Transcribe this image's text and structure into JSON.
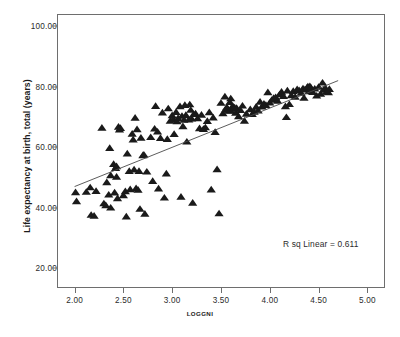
{
  "chart_data": {
    "type": "scatter",
    "title": "",
    "xlabel": "LOGGNI",
    "ylabel": "Life expectancy at birth, total (years)",
    "xlim": [
      1.82,
      5.18
    ],
    "ylim": [
      13.5,
      104.0
    ],
    "grid": false,
    "legend": null,
    "xticks": [
      "2.00",
      "2.50",
      "3.00",
      "3.50",
      "4.00",
      "4.50",
      "5.00"
    ],
    "xtick_values": [
      2.0,
      2.5,
      3.0,
      3.5,
      4.0,
      4.5,
      5.0
    ],
    "yticks": [
      "20.00",
      "40.00",
      "60.00",
      "80.00",
      "100.00"
    ],
    "ytick_values": [
      20,
      40,
      60,
      80,
      100
    ],
    "annotations": [
      {
        "text": "R sq Linear = 0.611",
        "x": 4.47,
        "y": 29.5
      }
    ],
    "fit_line": {
      "type": "linear",
      "r_squared": 0.611,
      "x": [
        2.0,
        4.7
      ],
      "y": [
        47.0,
        82.0
      ],
      "color": "#4a4a4a"
    },
    "marker": {
      "shape": "triangle-up",
      "color": "#1a1a1a",
      "size": 4.6
    },
    "points": [
      [
        2.01,
        45.0
      ],
      [
        2.02,
        42.0
      ],
      [
        2.12,
        45.1
      ],
      [
        2.16,
        46.6
      ],
      [
        2.17,
        37.5
      ],
      [
        2.2,
        37.2
      ],
      [
        2.22,
        45.4
      ],
      [
        2.28,
        66.3
      ],
      [
        2.3,
        41.3
      ],
      [
        2.32,
        40.7
      ],
      [
        2.33,
        48.3
      ],
      [
        2.35,
        44.2
      ],
      [
        2.36,
        59.6
      ],
      [
        2.37,
        50.6
      ],
      [
        2.37,
        39.9
      ],
      [
        2.4,
        54.3
      ],
      [
        2.41,
        44.9
      ],
      [
        2.42,
        53.0
      ],
      [
        2.43,
        53.6
      ],
      [
        2.43,
        50.1
      ],
      [
        2.44,
        43.0
      ],
      [
        2.45,
        66.6
      ],
      [
        2.46,
        65.7
      ],
      [
        2.47,
        66.2
      ],
      [
        2.5,
        44.0
      ],
      [
        2.52,
        45.3
      ],
      [
        2.53,
        37.0
      ],
      [
        2.54,
        57.8
      ],
      [
        2.56,
        52.0
      ],
      [
        2.57,
        46.0
      ],
      [
        2.59,
        64.3
      ],
      [
        2.6,
        62.4
      ],
      [
        2.61,
        52.5
      ],
      [
        2.62,
        69.6
      ],
      [
        2.63,
        46.3
      ],
      [
        2.64,
        65.8
      ],
      [
        2.65,
        45.8
      ],
      [
        2.66,
        52.0
      ],
      [
        2.67,
        39.5
      ],
      [
        2.68,
        63.0
      ],
      [
        2.7,
        57.2
      ],
      [
        2.71,
        57.4
      ],
      [
        2.72,
        37.9
      ],
      [
        2.74,
        51.8
      ],
      [
        2.78,
        63.2
      ],
      [
        2.8,
        48.7
      ],
      [
        2.82,
        66.0
      ],
      [
        2.83,
        73.5
      ],
      [
        2.85,
        65.0
      ],
      [
        2.86,
        46.2
      ],
      [
        2.88,
        62.9
      ],
      [
        2.9,
        71.3
      ],
      [
        2.92,
        43.2
      ],
      [
        2.94,
        51.2
      ],
      [
        2.95,
        62.6
      ],
      [
        2.96,
        72.7
      ],
      [
        2.98,
        68.6
      ],
      [
        3.0,
        70.4
      ],
      [
        3.01,
        69.2
      ],
      [
        3.02,
        64.2
      ],
      [
        3.04,
        71.5
      ],
      [
        3.05,
        68.4
      ],
      [
        3.06,
        69.5
      ],
      [
        3.08,
        73.4
      ],
      [
        3.09,
        43.5
      ],
      [
        3.1,
        70.2
      ],
      [
        3.11,
        66.8
      ],
      [
        3.12,
        68.9
      ],
      [
        3.13,
        73.8
      ],
      [
        3.14,
        70.5
      ],
      [
        3.15,
        61.7
      ],
      [
        3.17,
        69.0
      ],
      [
        3.18,
        74.0
      ],
      [
        3.19,
        72.2
      ],
      [
        3.2,
        69.3
      ],
      [
        3.21,
        41.5
      ],
      [
        3.22,
        70.8
      ],
      [
        3.24,
        71.0
      ],
      [
        3.26,
        69.4
      ],
      [
        3.28,
        66.1
      ],
      [
        3.3,
        70.6
      ],
      [
        3.32,
        65.9
      ],
      [
        3.34,
        66.4
      ],
      [
        3.36,
        68.5
      ],
      [
        3.38,
        71.4
      ],
      [
        3.4,
        45.9
      ],
      [
        3.42,
        69.7
      ],
      [
        3.44,
        64.9
      ],
      [
        3.46,
        52.6
      ],
      [
        3.48,
        38.0
      ],
      [
        3.5,
        74.5
      ],
      [
        3.52,
        71.1
      ],
      [
        3.54,
        76.6
      ],
      [
        3.55,
        72.5
      ],
      [
        3.56,
        73.1
      ],
      [
        3.57,
        72.3
      ],
      [
        3.58,
        71.9
      ],
      [
        3.59,
        74.8
      ],
      [
        3.6,
        72.0
      ],
      [
        3.6,
        76.0
      ],
      [
        3.61,
        72.9
      ],
      [
        3.62,
        73.5
      ],
      [
        3.63,
        72.6
      ],
      [
        3.64,
        73.0
      ],
      [
        3.65,
        71.2
      ],
      [
        3.66,
        72.8
      ],
      [
        3.68,
        70.1
      ],
      [
        3.7,
        72.1
      ],
      [
        3.72,
        73.6
      ],
      [
        3.74,
        68.6
      ],
      [
        3.76,
        70.9
      ],
      [
        3.8,
        72.4
      ],
      [
        3.82,
        70.8
      ],
      [
        3.84,
        71.6
      ],
      [
        3.86,
        73.2
      ],
      [
        3.88,
        72.0
      ],
      [
        3.9,
        74.9
      ],
      [
        3.92,
        73.3
      ],
      [
        3.94,
        74.2
      ],
      [
        3.96,
        73.8
      ],
      [
        3.98,
        78.0
      ],
      [
        4.0,
        74.6
      ],
      [
        4.02,
        75.5
      ],
      [
        4.04,
        76.1
      ],
      [
        4.06,
        76.4
      ],
      [
        4.08,
        75.2
      ],
      [
        4.1,
        77.3
      ],
      [
        4.12,
        78.2
      ],
      [
        4.14,
        76.8
      ],
      [
        4.16,
        73.4
      ],
      [
        4.17,
        69.8
      ],
      [
        4.18,
        78.6
      ],
      [
        4.2,
        74.1
      ],
      [
        4.22,
        77.0
      ],
      [
        4.24,
        78.4
      ],
      [
        4.26,
        76.5
      ],
      [
        4.28,
        79.0
      ],
      [
        4.3,
        78.7
      ],
      [
        4.32,
        77.8
      ],
      [
        4.34,
        79.3
      ],
      [
        4.35,
        76.2
      ],
      [
        4.36,
        78.9
      ],
      [
        4.38,
        79.5
      ],
      [
        4.39,
        79.9
      ],
      [
        4.4,
        78.3
      ],
      [
        4.41,
        80.0
      ],
      [
        4.42,
        79.6
      ],
      [
        4.44,
        78.1
      ],
      [
        4.46,
        79.2
      ],
      [
        4.48,
        76.9
      ],
      [
        4.5,
        79.8
      ],
      [
        4.52,
        77.5
      ],
      [
        4.54,
        81.2
      ],
      [
        4.55,
        78.8
      ],
      [
        4.57,
        79.4
      ],
      [
        4.58,
        78.2
      ],
      [
        4.6,
        78.0
      ],
      [
        4.61,
        79.1
      ]
    ]
  },
  "axis": {
    "x_title": "LOGGNI",
    "y_title": "Life expectancy at birth, total (years)"
  }
}
